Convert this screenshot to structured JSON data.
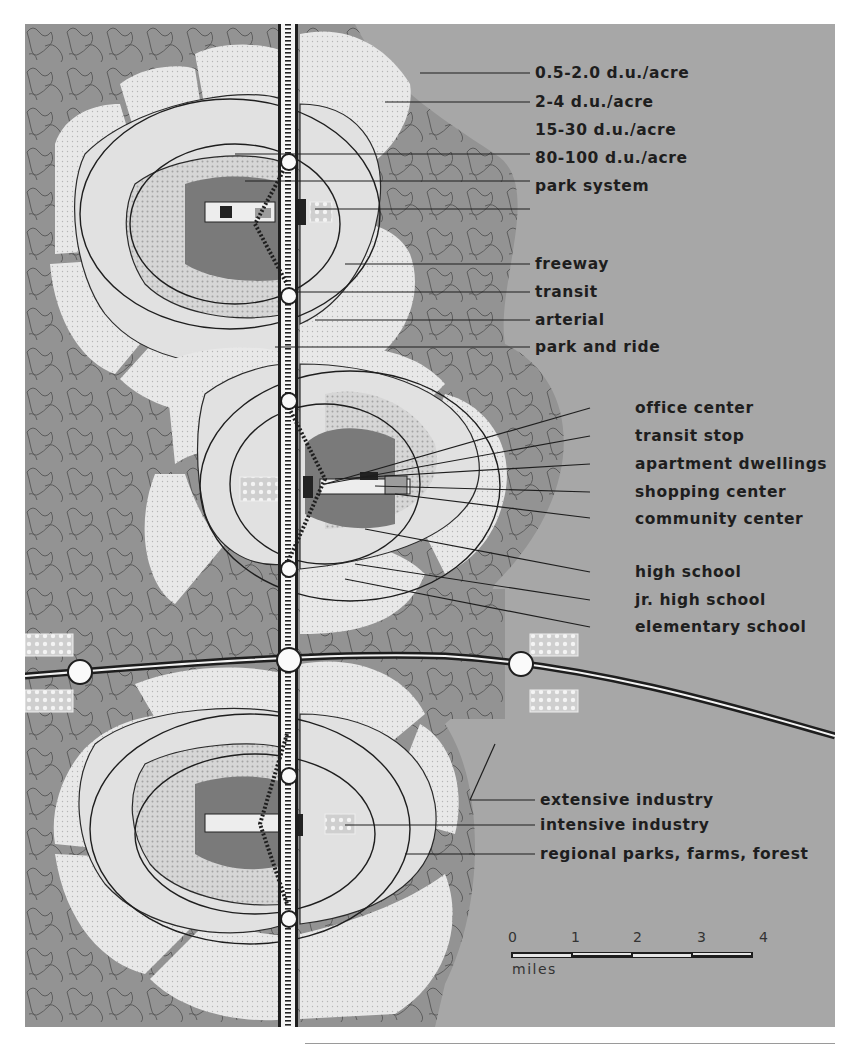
{
  "map": {
    "title": "Regional community plan diagram",
    "legend": {
      "density": [
        {
          "id": "very-low-density",
          "label": "0.5-2.0 d.u./acre"
        },
        {
          "id": "low-density",
          "label": "2-4 d.u./acre"
        },
        {
          "id": "medium-density",
          "label": "15-30 d.u./acre"
        },
        {
          "id": "high-density",
          "label": "80-100 d.u./acre"
        },
        {
          "id": "park-system",
          "label": "park system"
        }
      ],
      "transport": [
        {
          "id": "freeway",
          "label": "freeway"
        },
        {
          "id": "transit",
          "label": "transit"
        },
        {
          "id": "arterial",
          "label": "arterial"
        },
        {
          "id": "park-and-ride",
          "label": "park and ride"
        }
      ],
      "center": [
        {
          "id": "office-center",
          "label": "office center"
        },
        {
          "id": "transit-stop",
          "label": "transit stop"
        },
        {
          "id": "apartment-dwellings",
          "label": "apartment dwellings"
        },
        {
          "id": "shopping-center",
          "label": "shopping center"
        },
        {
          "id": "community-center",
          "label": "community center"
        }
      ],
      "schools": [
        {
          "id": "high-school",
          "label": "high school"
        },
        {
          "id": "jr-high-school",
          "label": "jr. high school"
        },
        {
          "id": "elementary-school",
          "label": "elementary school"
        }
      ],
      "regional": [
        {
          "id": "extensive-industry",
          "label": "extensive industry"
        },
        {
          "id": "intensive-industry",
          "label": "intensive industry"
        },
        {
          "id": "regional-parks",
          "label": "regional parks, farms, forest"
        }
      ]
    },
    "scale_bar": {
      "ticks": [
        "0",
        "1",
        "2",
        "3",
        "4"
      ],
      "unit": "miles"
    },
    "colors": {
      "background": "#a7a7a7",
      "regional_parks": "#8f8f8f",
      "residential_low": "#e6e6e6",
      "residential_med": "#d2d2d2",
      "high_density": "#777777",
      "road": "#1e1e1e",
      "ink": "#2a2a2a"
    }
  }
}
